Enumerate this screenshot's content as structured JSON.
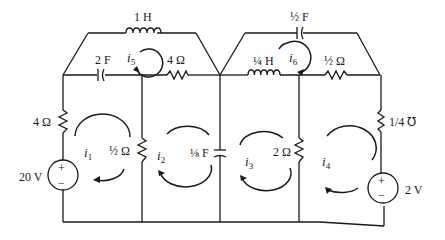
{
  "diagram": {
    "type": "circuit-schematic",
    "components": {
      "inductor_top_left": {
        "label": "1 H",
        "kind": "inductor"
      },
      "capacitor_2F": {
        "label": "2 F",
        "kind": "capacitor"
      },
      "resistor_4ohm_top": {
        "label": "4 Ω",
        "kind": "resistor"
      },
      "resistor_4ohm_left": {
        "label": "4 Ω",
        "kind": "resistor"
      },
      "source_20V": {
        "label": "20 V",
        "kind": "voltage-source",
        "plus": "+",
        "minus": "−"
      },
      "resistor_half_ohm_left": {
        "label": "½ Ω",
        "kind": "resistor"
      },
      "capacitor_eighth_F": {
        "label": "⅛ F",
        "kind": "capacitor"
      },
      "capacitor_half_F": {
        "label": "½ F",
        "kind": "capacitor"
      },
      "inductor_quarter_H": {
        "label": "¼ H",
        "kind": "inductor"
      },
      "resistor_half_ohm_right": {
        "label": "½ Ω",
        "kind": "resistor"
      },
      "resistor_2ohm": {
        "label": "2 Ω",
        "kind": "resistor"
      },
      "conductance_quarter_mho": {
        "label": "1/4 ℧",
        "kind": "resistor"
      },
      "source_2V": {
        "label": "2 V",
        "kind": "voltage-source",
        "plus": "+",
        "minus": "−"
      }
    },
    "mesh_currents": {
      "i1": {
        "symbol": "i",
        "sub": "1",
        "direction": "clockwise"
      },
      "i2": {
        "symbol": "i",
        "sub": "2",
        "direction": "clockwise"
      },
      "i3": {
        "symbol": "i",
        "sub": "3",
        "direction": "clockwise"
      },
      "i4": {
        "symbol": "i",
        "sub": "4",
        "direction": "clockwise"
      },
      "i5": {
        "symbol": "i",
        "sub": "5",
        "direction": "clockwise"
      },
      "i6": {
        "symbol": "i",
        "sub": "6",
        "direction": "clockwise"
      }
    }
  }
}
